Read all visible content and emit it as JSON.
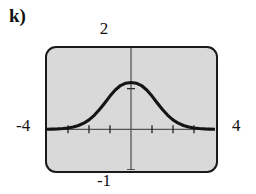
{
  "figure": {
    "part_label": "k)"
  },
  "screen": {
    "background_color": "#d9d9d9",
    "border_color": "#1a1a1a",
    "curve_color": "#141414",
    "axis_color": "#555555"
  },
  "labels": {
    "y_max": "2",
    "y_min": "-1",
    "x_min": "-4",
    "x_max": "4"
  },
  "chart_data": {
    "type": "line",
    "title": "",
    "xlabel": "",
    "ylabel": "",
    "xlim": [
      -4,
      4
    ],
    "ylim": [
      -1,
      2
    ],
    "grid": false,
    "legend": null,
    "x_ticks": [
      -3,
      -2,
      -1,
      1,
      2,
      3
    ],
    "y_ticks": [
      -1,
      1
    ],
    "axis_origin": [
      0,
      0
    ],
    "series": [
      {
        "name": "bell curve",
        "x": [
          -4.0,
          -3.75,
          -3.5,
          -3.25,
          -3.0,
          -2.75,
          -2.5,
          -2.25,
          -2.0,
          -1.75,
          -1.5,
          -1.25,
          -1.0,
          -0.75,
          -0.5,
          -0.25,
          0.0,
          0.25,
          0.5,
          0.75,
          1.0,
          1.25,
          1.5,
          1.75,
          2.0,
          2.25,
          2.5,
          2.75,
          3.0,
          3.25,
          3.5,
          3.75,
          4.0
        ],
        "y": [
          0.003,
          0.006,
          0.011,
          0.019,
          0.033,
          0.057,
          0.094,
          0.151,
          0.233,
          0.345,
          0.486,
          0.649,
          0.818,
          0.968,
          1.077,
          1.135,
          1.15,
          1.135,
          1.077,
          0.968,
          0.818,
          0.649,
          0.486,
          0.345,
          0.233,
          0.151,
          0.094,
          0.057,
          0.033,
          0.019,
          0.011,
          0.006,
          0.003
        ]
      }
    ]
  }
}
